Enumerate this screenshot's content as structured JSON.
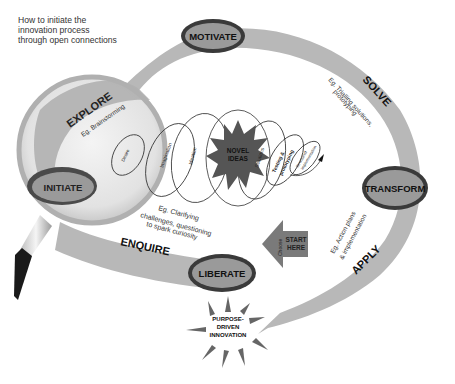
{
  "diagram": {
    "title": "How to initiate the innovation process through open connections",
    "title_lines": [
      "How to initiate the",
      "innovation process",
      "through open connections"
    ],
    "stages": [
      {
        "id": "initiate",
        "label": "INITIATE"
      },
      {
        "id": "motivate",
        "label": "MOTIVATE"
      },
      {
        "id": "transform",
        "label": "TRANSFORM"
      },
      {
        "id": "liberate",
        "label": "LIBERATE"
      }
    ],
    "phases": [
      {
        "id": "explore",
        "label": "EXPLORE",
        "example": "Eg. Brainstorming"
      },
      {
        "id": "solve",
        "label": "SOLVE",
        "example_lines": [
          "Eg. Trialling solutions,",
          "prototyping"
        ]
      },
      {
        "id": "apply",
        "label": "APPLY",
        "example_lines": [
          "Eg. Action plans",
          "& implementation"
        ]
      },
      {
        "id": "enquire",
        "label": "ENQUIRE",
        "example_lines": [
          "Eg. Clarifying",
          "challenges, questioning",
          "to spark curiosity"
        ]
      }
    ],
    "spiral_loops": [
      "Desire",
      "Imagination",
      "Ideation",
      "Solutions",
      "Testing & prototyping",
      "Structured implementation"
    ],
    "spiral_loop_lines": {
      "testing": [
        "Testing &",
        "prototyping"
      ],
      "structured": [
        "Structured",
        "implementation"
      ]
    },
    "center": {
      "lines": [
        "NOVEL",
        "IDEAS"
      ]
    },
    "start_arrow": {
      "lines": [
        "START",
        "HERE"
      ],
      "side_label": "Choose"
    },
    "outcome": {
      "lines": [
        "PURPOSE-",
        "DRIVEN",
        "INNOVATION"
      ]
    },
    "colors": {
      "band": "#b5b5b5",
      "ellipse_fill": "#8f8f8f",
      "ellipse_ring": "#3a3a3a",
      "star": "#555555",
      "arrow": "#7a7a7a",
      "handle": "#1a1a1a"
    }
  }
}
